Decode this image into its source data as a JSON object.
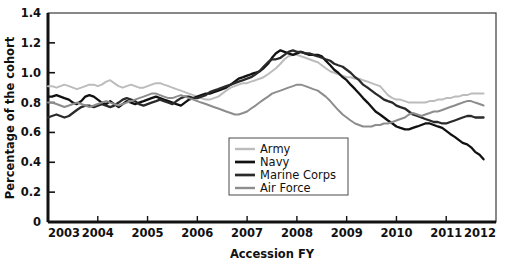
{
  "chart_data": {
    "type": "line",
    "title": "",
    "xlabel": "Accession FY",
    "ylabel": "Percentage of the cohort",
    "xlim": [
      2003,
      2012
    ],
    "ylim": [
      0,
      1.4
    ],
    "grid": false,
    "legend_position": "inside-bottom-center",
    "xticks": [
      "2003",
      "2004",
      "2005",
      "2006",
      "2007",
      "2008",
      "2009",
      "2010",
      "2011",
      "2012"
    ],
    "yticks": [
      "0",
      "0.2",
      "0.4",
      "0.6",
      "0.8",
      "1.0",
      "1.2",
      "1.4"
    ],
    "x": [
      2003.0,
      2003.08,
      2003.17,
      2003.25,
      2003.33,
      2003.42,
      2003.5,
      2003.58,
      2003.67,
      2003.75,
      2003.83,
      2003.92,
      2004.0,
      2004.08,
      2004.17,
      2004.25,
      2004.33,
      2004.42,
      2004.5,
      2004.58,
      2004.67,
      2004.75,
      2004.83,
      2004.92,
      2005.0,
      2005.08,
      2005.17,
      2005.25,
      2005.33,
      2005.42,
      2005.5,
      2005.58,
      2005.67,
      2005.75,
      2005.83,
      2005.92,
      2006.0,
      2006.08,
      2006.17,
      2006.25,
      2006.33,
      2006.42,
      2006.5,
      2006.58,
      2006.67,
      2006.75,
      2006.83,
      2006.92,
      2007.0,
      2007.08,
      2007.17,
      2007.25,
      2007.33,
      2007.42,
      2007.5,
      2007.58,
      2007.67,
      2007.75,
      2007.83,
      2007.92,
      2008.0,
      2008.08,
      2008.17,
      2008.25,
      2008.33,
      2008.42,
      2008.5,
      2008.58,
      2008.67,
      2008.75,
      2008.83,
      2008.92,
      2009.0,
      2009.08,
      2009.17,
      2009.25,
      2009.33,
      2009.42,
      2009.5,
      2009.58,
      2009.67,
      2009.75,
      2009.83,
      2009.92,
      2010.0,
      2010.08,
      2010.17,
      2010.25,
      2010.33,
      2010.42,
      2010.5,
      2010.58,
      2010.67,
      2010.75,
      2010.83,
      2010.92,
      2011.0,
      2011.08,
      2011.17,
      2011.25,
      2011.33,
      2011.42,
      2011.5,
      2011.58,
      2011.67,
      2011.75
    ],
    "series": [
      {
        "name": "Army",
        "color": "#bcbcbc",
        "width": 2.0,
        "values": [
          0.91,
          0.91,
          0.9,
          0.91,
          0.92,
          0.91,
          0.9,
          0.89,
          0.9,
          0.91,
          0.92,
          0.92,
          0.91,
          0.92,
          0.94,
          0.95,
          0.93,
          0.91,
          0.9,
          0.91,
          0.92,
          0.91,
          0.9,
          0.9,
          0.91,
          0.92,
          0.93,
          0.93,
          0.92,
          0.91,
          0.9,
          0.89,
          0.88,
          0.87,
          0.86,
          0.85,
          0.84,
          0.83,
          0.82,
          0.82,
          0.83,
          0.84,
          0.86,
          0.88,
          0.9,
          0.91,
          0.92,
          0.93,
          0.93,
          0.94,
          0.95,
          0.96,
          0.97,
          0.99,
          1.01,
          1.03,
          1.06,
          1.09,
          1.11,
          1.12,
          1.12,
          1.11,
          1.1,
          1.09,
          1.08,
          1.07,
          1.05,
          1.03,
          1.01,
          1.0,
          0.99,
          0.98,
          0.97,
          0.97,
          0.96,
          0.96,
          0.95,
          0.94,
          0.93,
          0.92,
          0.91,
          0.88,
          0.85,
          0.83,
          0.82,
          0.82,
          0.81,
          0.8,
          0.8,
          0.8,
          0.8,
          0.8,
          0.81,
          0.81,
          0.82,
          0.82,
          0.83,
          0.83,
          0.84,
          0.84,
          0.85,
          0.85,
          0.86,
          0.86,
          0.86,
          0.86
        ]
      },
      {
        "name": "Navy",
        "color": "#111111",
        "width": 2.3,
        "values": [
          0.84,
          0.84,
          0.85,
          0.84,
          0.83,
          0.82,
          0.8,
          0.79,
          0.81,
          0.84,
          0.85,
          0.84,
          0.82,
          0.8,
          0.79,
          0.81,
          0.79,
          0.77,
          0.79,
          0.81,
          0.8,
          0.79,
          0.8,
          0.81,
          0.82,
          0.83,
          0.84,
          0.83,
          0.82,
          0.81,
          0.8,
          0.79,
          0.78,
          0.8,
          0.82,
          0.83,
          0.84,
          0.85,
          0.86,
          0.86,
          0.87,
          0.88,
          0.89,
          0.9,
          0.92,
          0.94,
          0.96,
          0.97,
          0.98,
          0.99,
          1.0,
          1.01,
          1.03,
          1.06,
          1.1,
          1.13,
          1.15,
          1.14,
          1.13,
          1.12,
          1.13,
          1.14,
          1.13,
          1.12,
          1.12,
          1.12,
          1.11,
          1.08,
          1.05,
          1.02,
          1.0,
          0.97,
          0.95,
          0.92,
          0.89,
          0.86,
          0.83,
          0.8,
          0.77,
          0.74,
          0.72,
          0.7,
          0.68,
          0.66,
          0.64,
          0.63,
          0.62,
          0.62,
          0.63,
          0.64,
          0.65,
          0.66,
          0.66,
          0.65,
          0.64,
          0.63,
          0.61,
          0.59,
          0.57,
          0.55,
          0.53,
          0.52,
          0.5,
          0.47,
          0.45,
          0.42
        ]
      },
      {
        "name": "Marine Corps",
        "color": "#2a2a2a",
        "width": 2.3,
        "values": [
          0.7,
          0.71,
          0.72,
          0.71,
          0.7,
          0.71,
          0.73,
          0.75,
          0.77,
          0.78,
          0.78,
          0.77,
          0.78,
          0.79,
          0.78,
          0.77,
          0.78,
          0.8,
          0.82,
          0.83,
          0.82,
          0.81,
          0.79,
          0.78,
          0.79,
          0.8,
          0.81,
          0.82,
          0.81,
          0.8,
          0.79,
          0.81,
          0.83,
          0.84,
          0.84,
          0.83,
          0.83,
          0.84,
          0.85,
          0.87,
          0.88,
          0.89,
          0.9,
          0.91,
          0.92,
          0.93,
          0.94,
          0.95,
          0.96,
          0.97,
          0.99,
          1.01,
          1.04,
          1.07,
          1.09,
          1.09,
          1.1,
          1.12,
          1.14,
          1.15,
          1.14,
          1.14,
          1.13,
          1.13,
          1.12,
          1.11,
          1.1,
          1.09,
          1.08,
          1.06,
          1.05,
          1.04,
          1.02,
          1.0,
          0.97,
          0.95,
          0.92,
          0.9,
          0.88,
          0.86,
          0.84,
          0.82,
          0.81,
          0.8,
          0.78,
          0.77,
          0.76,
          0.74,
          0.72,
          0.71,
          0.7,
          0.69,
          0.68,
          0.67,
          0.67,
          0.66,
          0.66,
          0.67,
          0.68,
          0.69,
          0.7,
          0.71,
          0.71,
          0.7,
          0.7,
          0.7
        ]
      },
      {
        "name": "Air Force",
        "color": "#8d8d8d",
        "width": 2.0,
        "values": [
          0.8,
          0.8,
          0.79,
          0.78,
          0.77,
          0.78,
          0.79,
          0.8,
          0.79,
          0.78,
          0.77,
          0.78,
          0.79,
          0.8,
          0.81,
          0.8,
          0.79,
          0.78,
          0.79,
          0.8,
          0.81,
          0.82,
          0.83,
          0.84,
          0.85,
          0.86,
          0.86,
          0.85,
          0.84,
          0.83,
          0.83,
          0.84,
          0.85,
          0.84,
          0.83,
          0.82,
          0.81,
          0.8,
          0.79,
          0.78,
          0.77,
          0.76,
          0.75,
          0.74,
          0.73,
          0.72,
          0.72,
          0.73,
          0.74,
          0.76,
          0.78,
          0.8,
          0.82,
          0.84,
          0.86,
          0.87,
          0.88,
          0.89,
          0.9,
          0.91,
          0.92,
          0.92,
          0.91,
          0.9,
          0.89,
          0.88,
          0.86,
          0.84,
          0.81,
          0.78,
          0.75,
          0.72,
          0.7,
          0.68,
          0.66,
          0.65,
          0.64,
          0.64,
          0.64,
          0.65,
          0.65,
          0.66,
          0.66,
          0.67,
          0.68,
          0.69,
          0.7,
          0.72,
          0.73,
          0.72,
          0.71,
          0.72,
          0.73,
          0.74,
          0.74,
          0.75,
          0.76,
          0.77,
          0.78,
          0.79,
          0.8,
          0.81,
          0.81,
          0.8,
          0.79,
          0.78
        ]
      }
    ]
  },
  "legend": {
    "items": [
      {
        "label": "Army"
      },
      {
        "label": "Navy"
      },
      {
        "label": "Marine Corps"
      },
      {
        "label": "Air Force"
      }
    ]
  },
  "axes": {
    "x_title": "Accession FY",
    "y_title": "Percentage of the cohort"
  }
}
